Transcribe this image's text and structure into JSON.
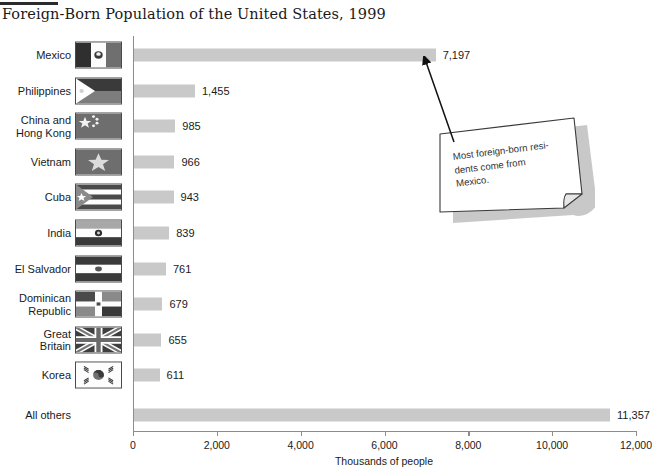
{
  "chart_data": {
    "type": "bar",
    "orientation": "horizontal",
    "title": "Foreign-Born Population of the United States, 1999",
    "xlabel": "Thousands of people",
    "ylabel": "",
    "xlim": [
      0,
      12000
    ],
    "xticks": [
      0,
      2000,
      4000,
      6000,
      8000,
      10000,
      12000
    ],
    "xtick_labels": [
      "0",
      "2,000",
      "4,000",
      "6,000",
      "8,000",
      "10,000",
      "12,000"
    ],
    "grid": false,
    "legend": "none",
    "bar_color": "#c9c9c9",
    "categories": [
      "Mexico",
      "Philippines",
      "China and\nHong Kong",
      "Vietnam",
      "Cuba",
      "India",
      "El Salvador",
      "Dominican\nRepublic",
      "Great\nBritain",
      "Korea",
      "All others"
    ],
    "values": [
      7197,
      1455,
      985,
      966,
      943,
      839,
      761,
      679,
      655,
      611,
      11357
    ],
    "value_labels": [
      "7,197",
      "1,455",
      "985",
      "966",
      "943",
      "839",
      "761",
      "679",
      "655",
      "611",
      "11,357"
    ],
    "annotations": [
      {
        "text": "Most foreign-born resi-\ndents come from\nMexico.",
        "points_to": "Mexico",
        "style": "sticky-note-with-arrow"
      }
    ]
  },
  "rows": [
    {
      "label": "Mexico",
      "value_label": "7,197",
      "flag": "flag-mexico",
      "has_flag": true
    },
    {
      "label": "Philippines",
      "value_label": "1,455",
      "flag": "flag-philippines",
      "has_flag": true
    },
    {
      "label": "China and\nHong Kong",
      "value_label": "985",
      "flag": "flag-china",
      "has_flag": true
    },
    {
      "label": "Vietnam",
      "value_label": "966",
      "flag": "flag-vietnam",
      "has_flag": true
    },
    {
      "label": "Cuba",
      "value_label": "943",
      "flag": "flag-cuba",
      "has_flag": true
    },
    {
      "label": "India",
      "value_label": "839",
      "flag": "flag-india",
      "has_flag": true
    },
    {
      "label": "El Salvador",
      "value_label": "761",
      "flag": "flag-el-salvador",
      "has_flag": true
    },
    {
      "label": "Dominican\nRepublic",
      "value_label": "679",
      "flag": "flag-dominican",
      "has_flag": true
    },
    {
      "label": "Great\nBritain",
      "value_label": "655",
      "flag": "flag-great-britain",
      "has_flag": true
    },
    {
      "label": "Korea",
      "value_label": "611",
      "flag": "flag-korea",
      "has_flag": true
    },
    {
      "label": "All others",
      "value_label": "11,357",
      "flag": "",
      "has_flag": false
    }
  ],
  "axis": {
    "title": "Thousands of people",
    "ticks": [
      "0",
      "2,000",
      "4,000",
      "6,000",
      "8,000",
      "10,000",
      "12,000"
    ]
  },
  "note": {
    "line1": "Most foreign-born resi-",
    "line2": "dents come from",
    "line3": "Mexico."
  }
}
